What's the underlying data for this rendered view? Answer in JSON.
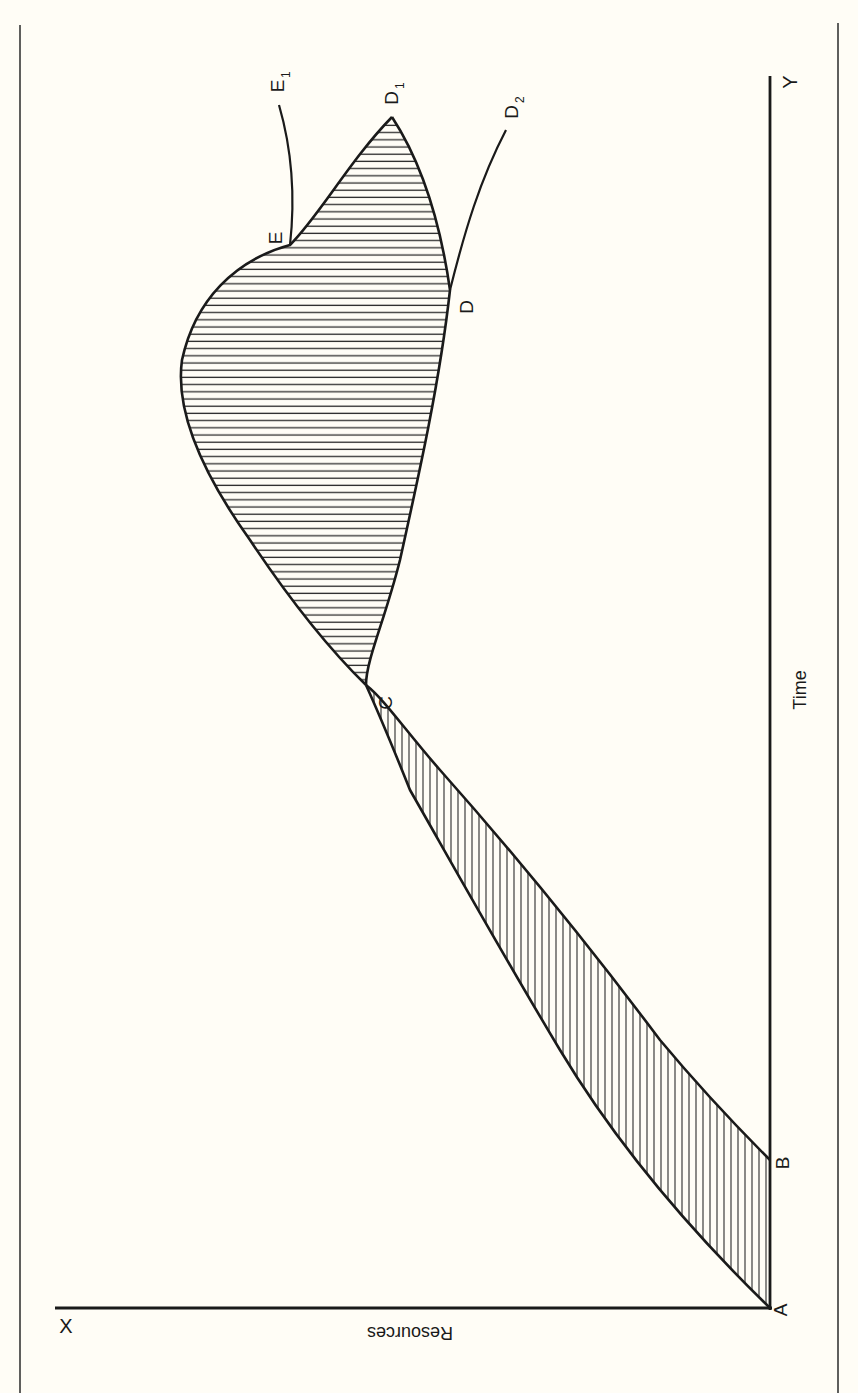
{
  "diagram": {
    "orientation": "page rotated 90 degrees; Time axis vertical on right, Resources axis horizontal at bottom",
    "axes": {
      "x_axis_label": "Resources",
      "x_axis_end_label": "X",
      "time_axis_label": "Time",
      "time_axis_end_label": "Y"
    },
    "points": {
      "A": "A",
      "B": "B",
      "C": "C",
      "D": "D",
      "D1": "D",
      "D1_sub": "1",
      "D2": "D",
      "D2_sub": "2",
      "E": "E",
      "E1": "E",
      "E1_sub": "1"
    },
    "regions": [
      {
        "name": "A-B-C region",
        "hatch": "vertical"
      },
      {
        "name": "C-D-D1-E region",
        "hatch": "horizontal"
      }
    ],
    "colors": {
      "background": "#fffdf6",
      "ink": "#1a1a1a"
    }
  }
}
